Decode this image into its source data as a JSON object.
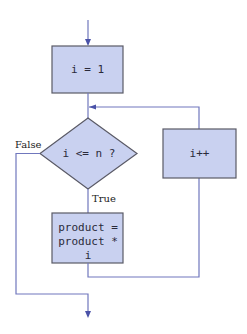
{
  "diagram": {
    "type": "flowchart",
    "colors": {
      "node_fill": "#c9d1f0",
      "node_border": "#5a5a66",
      "edge": "#7077bd",
      "arrowhead": "#4a52a8"
    },
    "nodes": {
      "init": {
        "shape": "rectangle",
        "label": "i = 1"
      },
      "condition": {
        "shape": "diamond",
        "label": "i <= n ?"
      },
      "body": {
        "shape": "rectangle",
        "lines": [
          "product =",
          "product *",
          "i"
        ]
      },
      "increment": {
        "shape": "rectangle",
        "label": "i++"
      }
    },
    "edge_labels": {
      "false": "False",
      "true": "True"
    },
    "edges": [
      {
        "from": "entry",
        "to": "init"
      },
      {
        "from": "init",
        "to": "condition"
      },
      {
        "from": "condition",
        "to": "body",
        "label": "True"
      },
      {
        "from": "body",
        "to": "increment"
      },
      {
        "from": "increment",
        "to": "condition"
      },
      {
        "from": "condition",
        "to": "exit",
        "label": "False"
      }
    ]
  }
}
